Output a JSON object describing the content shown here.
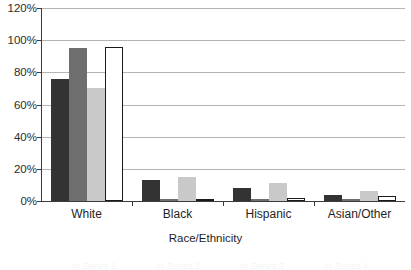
{
  "chart_data": {
    "type": "bar",
    "title": "",
    "xlabel": "Race/Ethnicity",
    "ylabel": "",
    "categories": [
      "White",
      "Black",
      "Hispanic",
      "Asian/Other"
    ],
    "ylim": [
      0,
      120
    ],
    "ytick_values": [
      0,
      20,
      40,
      60,
      80,
      100,
      120
    ],
    "ytick_labels": [
      "0%",
      "20%",
      "40%",
      "60%",
      "80%",
      "100%",
      "120%"
    ],
    "grid": true,
    "legend_position": "bottom",
    "series": [
      {
        "name": "Series 1",
        "color": "#333333",
        "values": [
          76,
          13,
          8,
          4
        ]
      },
      {
        "name": "Series 2",
        "color": "#6e6e6e",
        "values": [
          95,
          1,
          1,
          1
        ]
      },
      {
        "name": "Series 3",
        "color": "#c9c9c9",
        "values": [
          70,
          15,
          11,
          6
        ]
      },
      {
        "name": "Series 4",
        "color": "#ffffff",
        "values": [
          96,
          1,
          2,
          3
        ]
      }
    ]
  },
  "axis": {
    "x_title": "Race/Ethnicity"
  }
}
